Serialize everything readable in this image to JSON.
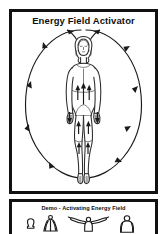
{
  "page": {
    "background_color": "#ffffff",
    "ink_color": "#1a1a1a"
  },
  "main_panel": {
    "title": "Energy Field Activator",
    "border_color": "#111111",
    "figure": {
      "name": "standing-female-figure",
      "description": "front-facing standing woman with shoulder-length hair, arms at sides"
    },
    "energy_field": {
      "name": "oval-energy-field",
      "shape": "oval",
      "flow_arrows": [
        {
          "id": "crown-left",
          "direction": "up-left",
          "position": "above-head-left"
        },
        {
          "id": "crown-right",
          "direction": "up-right",
          "position": "above-head-right"
        },
        {
          "id": "left-arc-upper",
          "direction": "down-left",
          "position": "left-arc-upper"
        },
        {
          "id": "left-arc-mid",
          "direction": "down",
          "position": "left-arc-middle"
        },
        {
          "id": "left-arc-lower",
          "direction": "down",
          "position": "left-arc-lower"
        },
        {
          "id": "left-arc-foot",
          "direction": "right-down",
          "position": "left-arc-bottom"
        },
        {
          "id": "right-arc-upper",
          "direction": "down-left",
          "position": "right-arc-upper"
        },
        {
          "id": "right-arc-mid",
          "direction": "down",
          "position": "right-arc-middle"
        },
        {
          "id": "right-arc-lower",
          "direction": "down-left",
          "position": "right-arc-lower"
        },
        {
          "id": "right-arc-foot",
          "direction": "left",
          "position": "right-arc-bottom"
        },
        {
          "id": "torso-center-up",
          "direction": "up",
          "position": "center-torso"
        },
        {
          "id": "torso-left-up",
          "direction": "up",
          "position": "left-torso"
        },
        {
          "id": "torso-right-up",
          "direction": "up",
          "position": "right-torso"
        },
        {
          "id": "hand-left-down",
          "direction": "down",
          "position": "left-hand"
        },
        {
          "id": "hand-right-down",
          "direction": "down",
          "position": "right-hand"
        },
        {
          "id": "thigh-left-up",
          "direction": "up",
          "position": "left-thigh"
        },
        {
          "id": "thigh-right-up",
          "direction": "up",
          "position": "right-thigh"
        },
        {
          "id": "knee-left-up",
          "direction": "up",
          "position": "left-knee"
        },
        {
          "id": "knee-right-up",
          "direction": "up",
          "position": "right-knee"
        }
      ]
    }
  },
  "demo_panel": {
    "title": "Demo - Activating Energy Field",
    "border_color": "#111111",
    "figures": [
      {
        "id": "demo-pose-1",
        "name": "seated-figure",
        "description": "small seated figure, arms down"
      },
      {
        "id": "demo-pose-2",
        "name": "hands-overhead-figure",
        "description": "figure with hands joined above head"
      },
      {
        "id": "demo-pose-3",
        "name": "arms-outstretched-figure",
        "description": "figure with arms sweeping outward"
      },
      {
        "id": "demo-pose-4",
        "name": "arms-down-figure",
        "description": "standing figure with arms at sides"
      }
    ]
  }
}
